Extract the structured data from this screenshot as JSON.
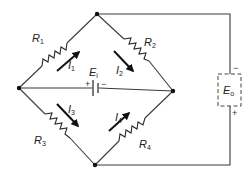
{
  "diagram": {
    "type": "wheatstone-bridge-circuit",
    "resistors": [
      {
        "name": "R",
        "sub": "1"
      },
      {
        "name": "R",
        "sub": "2"
      },
      {
        "name": "R",
        "sub": "3"
      },
      {
        "name": "R",
        "sub": "4"
      }
    ],
    "currents": [
      {
        "name": "I",
        "sub": "1"
      },
      {
        "name": "I",
        "sub": "2"
      },
      {
        "name": "I",
        "sub": "3"
      },
      {
        "name": "I",
        "sub": "4"
      }
    ],
    "source": {
      "name": "E",
      "sub": "i",
      "plus": "+",
      "minus": "−"
    },
    "output": {
      "name": "E",
      "sub": "o",
      "plus": "+",
      "minus": "−"
    }
  }
}
